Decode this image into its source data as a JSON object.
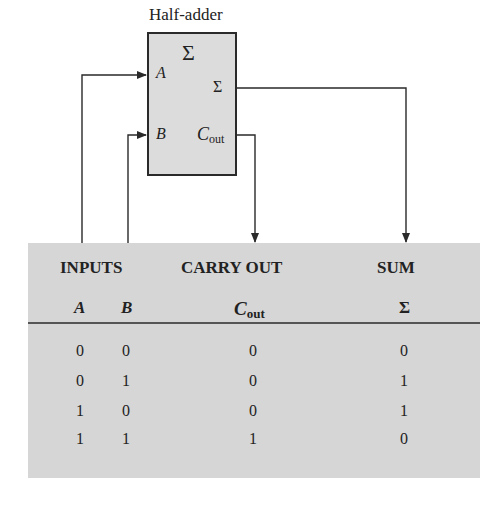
{
  "diagram": {
    "title": "Half-adder",
    "block": {
      "symbol": "Σ",
      "inputs": [
        {
          "label": "A"
        },
        {
          "label": "B"
        }
      ],
      "outputs": [
        {
          "label": "Σ"
        },
        {
          "label_main": "C",
          "label_sub": "out"
        }
      ]
    },
    "colors": {
      "block_fill": "#dcdcdc",
      "table_fill": "#d6d6d6",
      "line": "#2a2a2a"
    }
  },
  "truth_table": {
    "group_headers": {
      "inputs": "INPUTS",
      "carry_out": "CARRY OUT",
      "sum": "SUM"
    },
    "columns": {
      "a": "A",
      "b": "B",
      "cout_main": "C",
      "cout_sub": "out",
      "sum": "Σ"
    },
    "rows": [
      {
        "a": "0",
        "b": "0",
        "cout": "0",
        "sum": "0"
      },
      {
        "a": "0",
        "b": "1",
        "cout": "0",
        "sum": "1"
      },
      {
        "a": "1",
        "b": "0",
        "cout": "0",
        "sum": "1"
      },
      {
        "a": "1",
        "b": "1",
        "cout": "1",
        "sum": "0"
      }
    ]
  }
}
